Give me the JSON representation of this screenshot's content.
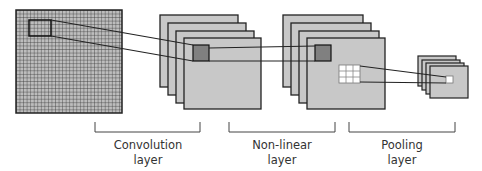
{
  "diagram": {
    "stages": [
      {
        "id": "input",
        "label": ""
      },
      {
        "id": "conv",
        "label_line1": "Convolution",
        "label_line2": "layer"
      },
      {
        "id": "nonlinear",
        "label_line1": "Non-linear",
        "label_line2": "layer"
      },
      {
        "id": "pooling",
        "label_line1": "Pooling",
        "label_line2": "layer"
      }
    ],
    "colors": {
      "layer_fill": "#c8c8c8",
      "stroke": "#222222",
      "highlight_dark": "#808080",
      "highlight_light": "#ffffff",
      "grid_fill": "#b0b0b0"
    }
  }
}
